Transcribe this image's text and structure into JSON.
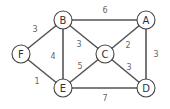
{
  "graph": {
    "nodes": [
      {
        "id": "A",
        "label": "A",
        "x": 146,
        "y": 20
      },
      {
        "id": "B",
        "label": "B",
        "x": 63,
        "y": 20
      },
      {
        "id": "C",
        "label": "C",
        "x": 105,
        "y": 54
      },
      {
        "id": "D",
        "label": "D",
        "x": 146,
        "y": 88
      },
      {
        "id": "E",
        "label": "E",
        "x": 63,
        "y": 88
      },
      {
        "id": "F",
        "label": "F",
        "x": 21,
        "y": 54
      }
    ],
    "edges": [
      {
        "from": "B",
        "to": "A",
        "weight": "6"
      },
      {
        "from": "F",
        "to": "B",
        "weight": "3"
      },
      {
        "from": "B",
        "to": "E",
        "weight": "4"
      },
      {
        "from": "B",
        "to": "C",
        "weight": "3"
      },
      {
        "from": "A",
        "to": "C",
        "weight": "2"
      },
      {
        "from": "A",
        "to": "D",
        "weight": "3"
      },
      {
        "from": "C",
        "to": "E",
        "weight": "5"
      },
      {
        "from": "C",
        "to": "D",
        "weight": "3"
      },
      {
        "from": "F",
        "to": "E",
        "weight": "1"
      },
      {
        "from": "E",
        "to": "D",
        "weight": "7"
      }
    ]
  }
}
